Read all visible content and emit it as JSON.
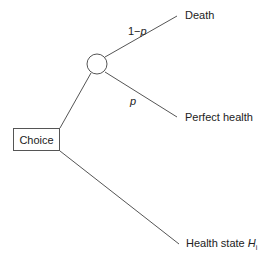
{
  "diagram": {
    "type": "decision-tree",
    "decision_node": {
      "label": "Choice"
    },
    "chance_node": {
      "shape": "circle"
    },
    "branches": [
      {
        "prob_prefix": "1−",
        "prob_var": "p",
        "outcome": "Death"
      },
      {
        "prob_prefix": "",
        "prob_var": "p",
        "outcome": "Perfect health"
      }
    ],
    "alternative": {
      "outcome_prefix": "Health state ",
      "outcome_var": "H",
      "outcome_sub": "i"
    },
    "colors": {
      "line": "#555555",
      "text": "#222222"
    }
  }
}
